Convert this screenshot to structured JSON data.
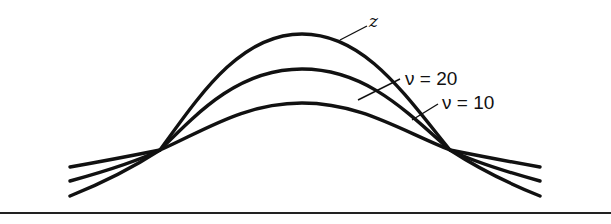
{
  "figure": {
    "labels": {
      "z": "z",
      "v20": "ν = 20",
      "v10": "ν = 10"
    },
    "curves": [
      {
        "name": "z",
        "peak_y": 34,
        "tail_y": 196
      },
      {
        "name": "v=20",
        "peak_y": 69,
        "tail_y": 181
      },
      {
        "name": "v=10",
        "peak_y": 103,
        "tail_y": 167
      }
    ],
    "colors": {
      "ink": "#111111",
      "background": "#ffffff"
    }
  }
}
